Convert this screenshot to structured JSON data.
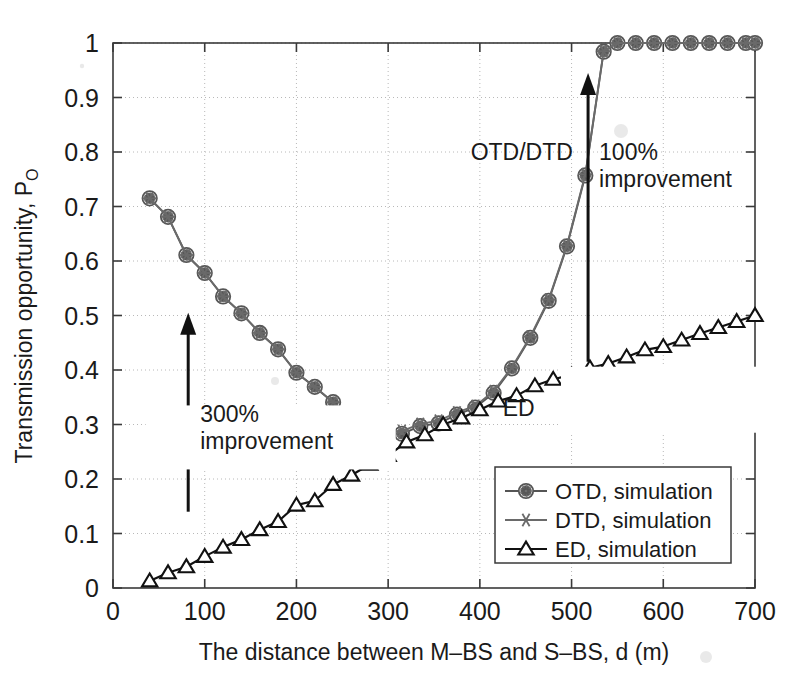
{
  "chart_data": {
    "type": "line",
    "title": "",
    "xlabel": "The distance between M–BS and S–BS, d (m)",
    "ylabel": "Transmission opportunity, P",
    "ylabel_sub": "O",
    "xlim": [
      0,
      700
    ],
    "ylim": [
      0,
      1
    ],
    "xticks": [
      0,
      100,
      200,
      300,
      400,
      500,
      600,
      700
    ],
    "yticks": [
      0,
      0.1,
      0.2,
      0.3,
      0.4,
      0.5,
      0.6,
      0.7,
      0.8,
      0.9,
      1
    ],
    "xtick_labels": [
      "0",
      "100",
      "200",
      "300",
      "400",
      "500",
      "600",
      "700"
    ],
    "ytick_labels": [
      "0",
      "0.1",
      "0.2",
      "0.3",
      "0.4",
      "0.5",
      "0.6",
      "0.7",
      "0.8",
      "0.9",
      "1"
    ],
    "grid": true,
    "legend_position": "lower right",
    "series": [
      {
        "name": "OTD, simulation",
        "marker": "circle",
        "color": "#555555",
        "x": [
          40,
          60,
          80,
          100,
          120,
          140,
          160,
          180,
          200,
          220,
          240,
          260,
          275,
          295,
          315,
          335,
          355,
          375,
          395,
          415,
          435,
          455,
          475,
          495,
          515,
          535,
          550,
          570,
          590,
          610,
          630,
          650,
          670,
          690,
          700
        ],
        "y": [
          0.715,
          0.681,
          0.611,
          0.578,
          0.535,
          0.504,
          0.468,
          0.438,
          0.395,
          0.369,
          0.341,
          0.304,
          0.283,
          0.266,
          0.283,
          0.297,
          0.302,
          0.318,
          0.331,
          0.358,
          0.403,
          0.459,
          0.527,
          0.627,
          0.757,
          0.984,
          1.0,
          1.0,
          1.0,
          1.0,
          1.0,
          1.0,
          1.0,
          1.0,
          1.0
        ]
      },
      {
        "name": "DTD, simulation",
        "marker": "asterisk",
        "color": "#6a6a6a",
        "x": [
          40,
          60,
          80,
          100,
          120,
          140,
          160,
          180,
          200,
          220,
          240,
          260,
          275,
          295,
          315,
          335,
          355,
          375,
          395,
          415,
          435,
          455,
          475,
          495,
          515,
          535,
          550,
          570,
          590,
          610,
          630,
          650,
          670,
          690,
          700
        ],
        "y": [
          0.715,
          0.681,
          0.611,
          0.578,
          0.535,
          0.504,
          0.468,
          0.438,
          0.395,
          0.369,
          0.341,
          0.304,
          0.287,
          0.272,
          0.288,
          0.301,
          0.307,
          0.322,
          0.334,
          0.361,
          0.405,
          0.461,
          0.529,
          0.629,
          0.759,
          0.985,
          1.0,
          1.0,
          1.0,
          1.0,
          1.0,
          1.0,
          1.0,
          1.0,
          1.0
        ]
      },
      {
        "name": "ED, simulation",
        "marker": "triangle",
        "color": "#111111",
        "x": [
          40,
          60,
          80,
          100,
          120,
          140,
          160,
          180,
          200,
          220,
          240,
          260,
          280,
          300,
          320,
          340,
          360,
          380,
          400,
          420,
          440,
          460,
          480,
          500,
          520,
          540,
          560,
          580,
          600,
          620,
          640,
          660,
          680,
          700
        ],
        "y": [
          0.013,
          0.028,
          0.039,
          0.058,
          0.075,
          0.089,
          0.107,
          0.122,
          0.152,
          0.16,
          0.19,
          0.207,
          0.227,
          0.243,
          0.268,
          0.281,
          0.3,
          0.312,
          0.327,
          0.343,
          0.353,
          0.371,
          0.383,
          0.391,
          0.404,
          0.412,
          0.424,
          0.437,
          0.443,
          0.455,
          0.467,
          0.478,
          0.489,
          0.5
        ]
      }
    ],
    "annotations": [
      {
        "text": "OTD/DTD",
        "x": 390,
        "y": 0.785
      },
      {
        "text": "ED",
        "x": 425,
        "y": 0.315
      },
      {
        "text": "300%",
        "x": 95,
        "y": 0.305
      },
      {
        "text": "improvement",
        "x": 95,
        "y": 0.255
      },
      {
        "text": "100%",
        "x": 530,
        "y": 0.785
      },
      {
        "text": "improvement",
        "x": 530,
        "y": 0.735
      }
    ],
    "arrows": [
      {
        "name": "arrow-300-improvement",
        "x": 82,
        "y_from": 0.14,
        "y_to": 0.505
      },
      {
        "name": "arrow-100-improvement",
        "x": 518,
        "y_from": 0.415,
        "y_to": 0.945
      }
    ]
  },
  "legend": {
    "entries": [
      {
        "label": "OTD, simulation",
        "marker": "circle"
      },
      {
        "label": "DTD, simulation",
        "marker": "asterisk"
      },
      {
        "label": "ED, simulation",
        "marker": "triangle"
      }
    ]
  },
  "colors": {
    "axis": "#3a3a3a",
    "grid": "#b8b8b8",
    "otd": "#555555",
    "dtd": "#6a6a6a",
    "ed": "#111111",
    "background": "#ffffff"
  }
}
